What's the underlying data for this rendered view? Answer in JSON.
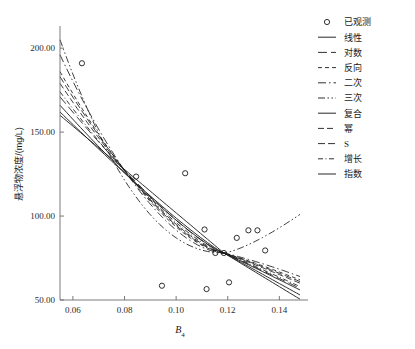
{
  "chart_data": {
    "type": "scatter",
    "title": "",
    "xlabel": "B4",
    "xlabel_base": "B",
    "xlabel_sub": "4",
    "ylabel": "悬浮物浓度/(mg/L)",
    "xlim": [
      0.055,
      0.148
    ],
    "ylim": [
      50.0,
      212.0
    ],
    "xticks": [
      0.06,
      0.08,
      0.1,
      0.12,
      0.14
    ],
    "xtick_labels": [
      "0.06",
      "0.08",
      "0.10",
      "0.12",
      "0.14"
    ],
    "yticks": [
      50.0,
      100.0,
      150.0,
      200.0
    ],
    "ytick_labels": [
      "50.00",
      "100.00",
      "150.00",
      "200.00"
    ],
    "grid": false,
    "legend_position": "right-top",
    "observed": {
      "name": "已观测",
      "marker": "open-circle",
      "points": [
        {
          "x": 0.0635,
          "y": 191.0
        },
        {
          "x": 0.0845,
          "y": 123.5
        },
        {
          "x": 0.0945,
          "y": 58.5
        },
        {
          "x": 0.1035,
          "y": 125.5
        },
        {
          "x": 0.111,
          "y": 92.0
        },
        {
          "x": 0.1118,
          "y": 56.5
        },
        {
          "x": 0.1152,
          "y": 78.0
        },
        {
          "x": 0.1185,
          "y": 78.0
        },
        {
          "x": 0.1205,
          "y": 60.5
        },
        {
          "x": 0.1235,
          "y": 87.0
        },
        {
          "x": 0.128,
          "y": 91.5
        },
        {
          "x": 0.1315,
          "y": 91.5
        },
        {
          "x": 0.1345,
          "y": 79.5
        }
      ]
    },
    "series": [
      {
        "name": "线性",
        "dash": "solid",
        "start_y": 160.0,
        "end_y": 50.5,
        "curvature": 0.0,
        "tail": "down"
      },
      {
        "name": "对数",
        "dash": "long-dash",
        "start_y": 171.0,
        "end_y": 57.0,
        "curvature": 0.12,
        "tail": "down"
      },
      {
        "name": "反向",
        "dash": "short-dash",
        "start_y": 186.0,
        "end_y": 62.0,
        "curvature": 0.26,
        "tail": "down"
      },
      {
        "name": "二次",
        "dash": "dash-dot",
        "start_y": 196.0,
        "end_y": 64.0,
        "curvature": 0.34,
        "tail": "down"
      },
      {
        "name": "三次",
        "dash": "dash-dot-dot",
        "start_y": 205.0,
        "end_y": 101.0,
        "curvature": 0.52,
        "tail": "up"
      },
      {
        "name": "复合",
        "dash": "solid",
        "start_y": 166.0,
        "end_y": 56.0,
        "curvature": 0.1,
        "tail": "down"
      },
      {
        "name": "幂",
        "dash": "med-dash",
        "start_y": 179.0,
        "end_y": 60.0,
        "curvature": 0.2,
        "tail": "down"
      },
      {
        "name": "S",
        "dash": "med-dash2",
        "start_y": 183.0,
        "end_y": 61.0,
        "curvature": 0.23,
        "tail": "down"
      },
      {
        "name": "增长",
        "dash": "fine-dash-dot",
        "start_y": 174.0,
        "end_y": 58.0,
        "curvature": 0.16,
        "tail": "down"
      },
      {
        "name": "指数",
        "dash": "solid",
        "start_y": 162.0,
        "end_y": 53.0,
        "curvature": 0.06,
        "tail": "down"
      }
    ],
    "converge": {
      "x": 0.1185,
      "y": 78.0
    }
  },
  "legend": {
    "items": [
      {
        "label": "已观测",
        "type": "marker",
        "style": "open-circle"
      },
      {
        "label": "线性",
        "type": "line",
        "style": "solid"
      },
      {
        "label": "对数",
        "type": "line",
        "style": "long-dash"
      },
      {
        "label": "反向",
        "type": "line",
        "style": "short-dash"
      },
      {
        "label": "二次",
        "type": "line",
        "style": "dash-dot"
      },
      {
        "label": "三次",
        "type": "line",
        "style": "dash-dot-dot"
      },
      {
        "label": "复合",
        "type": "line",
        "style": "solid"
      },
      {
        "label": "幂",
        "type": "line",
        "style": "med-dash"
      },
      {
        "label": "S",
        "type": "line",
        "style": "med-dash2"
      },
      {
        "label": "增长",
        "type": "line",
        "style": "fine-dash-dot"
      },
      {
        "label": "指数",
        "type": "line",
        "style": "solid"
      }
    ]
  },
  "colors": {
    "line": "#1a1a1a",
    "axis": "#6b6b6b",
    "text": "#1a1a1a",
    "background": "#ffffff"
  }
}
